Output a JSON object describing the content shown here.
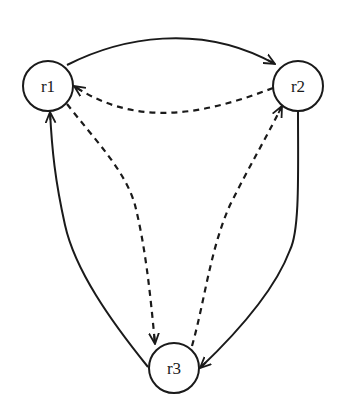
{
  "diagram": {
    "type": "directed-graph",
    "colors": {
      "stroke": "#1a1a1a",
      "background": "#ffffff"
    },
    "nodes": [
      {
        "id": "r1",
        "label": "r1"
      },
      {
        "id": "r2",
        "label": "r2"
      },
      {
        "id": "r3",
        "label": "r3"
      }
    ],
    "edges": [
      {
        "from": "r1",
        "to": "r2",
        "style": "solid"
      },
      {
        "from": "r2",
        "to": "r1",
        "style": "dashed"
      },
      {
        "from": "r2",
        "to": "r3",
        "style": "solid"
      },
      {
        "from": "r3",
        "to": "r2",
        "style": "dashed"
      },
      {
        "from": "r3",
        "to": "r1",
        "style": "solid"
      },
      {
        "from": "r1",
        "to": "r3",
        "style": "dashed"
      }
    ]
  }
}
